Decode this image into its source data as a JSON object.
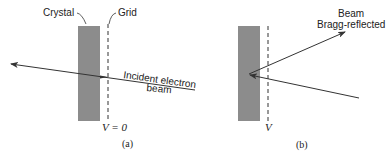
{
  "panels": {
    "a": {
      "caption": "(a)",
      "crystal_label": "Crystal",
      "grid_label": "Grid",
      "beam_label_line1": "Incident electron",
      "beam_label_line2": "beam",
      "voltage_label": "V = 0"
    },
    "b": {
      "caption": "(b)",
      "beam_label_line1": "Beam",
      "beam_label_line2": "Bragg-reflected",
      "voltage_label": "V"
    }
  },
  "colors": {
    "crystal_fill": "#8c8c8c",
    "line": "#333333",
    "text": "#222222"
  }
}
